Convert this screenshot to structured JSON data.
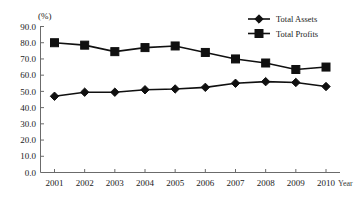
{
  "chart_data": {
    "type": "line",
    "title": "",
    "subtitle": "",
    "xlabel": "Year",
    "ylabel": "(%)",
    "ylim": [
      0.0,
      90.0
    ],
    "yticks": [
      "0.0",
      "10.0",
      "20.0",
      "30.0",
      "40.0",
      "50.0",
      "60.0",
      "70.0",
      "80.0",
      "90.0"
    ],
    "ytick_values": [
      0.0,
      10.0,
      20.0,
      30.0,
      40.0,
      50.0,
      60.0,
      70.0,
      80.0,
      90.0
    ],
    "grid": false,
    "legend_position": "top-right",
    "categories": [
      "2001",
      "2002",
      "2003",
      "2004",
      "2005",
      "2006",
      "2007",
      "2008",
      "2009",
      "2010"
    ],
    "x": [
      2001,
      2002,
      2003,
      2004,
      2005,
      2006,
      2007,
      2008,
      2009,
      2010
    ],
    "series": [
      {
        "name": "Total Assets",
        "marker": "diamond",
        "color": "#101010",
        "values": [
          47.0,
          49.5,
          49.5,
          51.0,
          51.5,
          52.5,
          55.0,
          56.0,
          55.5,
          53.0
        ]
      },
      {
        "name": "Total Profits",
        "marker": "square",
        "color": "#101010",
        "values": [
          80.0,
          78.5,
          74.5,
          77.0,
          78.0,
          74.0,
          70.0,
          67.5,
          63.5,
          65.0
        ]
      }
    ],
    "annotations": []
  },
  "axes": {
    "unit_label": "(%)",
    "x_axis_name": "Year"
  },
  "legend": {
    "entries": [
      {
        "label": "Total Assets",
        "marker": "diamond-marker"
      },
      {
        "label": "Total Profits",
        "marker": "square-marker"
      }
    ]
  }
}
